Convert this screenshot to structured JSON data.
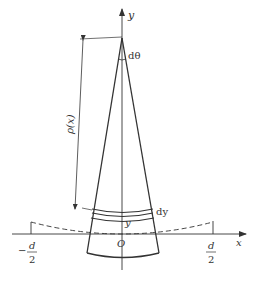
{
  "diagram": {
    "type": "geometry-sketch",
    "axes": {
      "x_label": "x",
      "y_label": "y",
      "origin_label": "O"
    },
    "labels": {
      "angle": "dθ",
      "radius": "ρ(x)",
      "strip_thickness": "dy",
      "strip_height": "y",
      "left_limit_num": "d",
      "left_limit_den": "2",
      "left_limit_sign": "−",
      "right_limit_num": "d",
      "right_limit_den": "2"
    },
    "colors": {
      "stroke": "#333333",
      "background": "#ffffff"
    }
  }
}
